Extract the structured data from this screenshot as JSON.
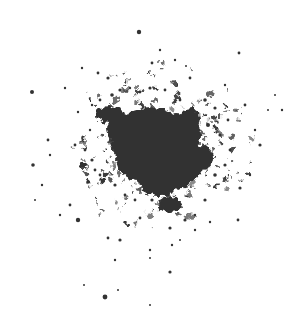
{
  "image": {
    "width": 303,
    "height": 335,
    "background": "#ffffff",
    "subject": "dark particle splatter cluster",
    "ink_color": "#333333",
    "core": {
      "cx": 158,
      "cy": 147,
      "blobs": [
        {
          "cx": 150,
          "cy": 140,
          "rx": 40,
          "ry": 32
        },
        {
          "cx": 168,
          "cy": 160,
          "rx": 36,
          "ry": 30
        },
        {
          "cx": 140,
          "cy": 160,
          "rx": 24,
          "ry": 20
        },
        {
          "cx": 175,
          "cy": 135,
          "rx": 26,
          "ry": 22
        },
        {
          "cx": 160,
          "cy": 180,
          "rx": 22,
          "ry": 16
        },
        {
          "cx": 125,
          "cy": 130,
          "rx": 18,
          "ry": 14
        },
        {
          "cx": 110,
          "cy": 115,
          "rx": 14,
          "ry": 8
        },
        {
          "cx": 190,
          "cy": 118,
          "rx": 10,
          "ry": 10
        },
        {
          "cx": 200,
          "cy": 158,
          "rx": 14,
          "ry": 12
        },
        {
          "cx": 170,
          "cy": 205,
          "rx": 12,
          "ry": 8
        }
      ]
    },
    "specks": [
      [
        139,
        32,
        2.2
      ],
      [
        32,
        92,
        2
      ],
      [
        33,
        165,
        1.8
      ],
      [
        105,
        297,
        2.4
      ],
      [
        170,
        272,
        1.6
      ],
      [
        239,
        53,
        1.4
      ],
      [
        78,
        220,
        2.2
      ],
      [
        120,
        240,
        1.6
      ],
      [
        108,
        238,
        1.4
      ],
      [
        170,
        228,
        1.6
      ],
      [
        240,
        188,
        1.6
      ],
      [
        238,
        220,
        1.4
      ],
      [
        260,
        145,
        1.6
      ],
      [
        245,
        105,
        1.4
      ],
      [
        225,
        85,
        1.2
      ],
      [
        205,
        100,
        1.8
      ],
      [
        190,
        78,
        1.4
      ],
      [
        152,
        63,
        1.4
      ],
      [
        160,
        50,
        1.2
      ],
      [
        98,
        73,
        1.4
      ],
      [
        108,
        78,
        1.6
      ],
      [
        92,
        105,
        1.2
      ],
      [
        78,
        112,
        1.2
      ],
      [
        48,
        140,
        1.4
      ],
      [
        50,
        155,
        1.2
      ],
      [
        42,
        185,
        1.2
      ],
      [
        70,
        205,
        1.4
      ],
      [
        88,
        182,
        1.8
      ],
      [
        95,
        170,
        1.4
      ],
      [
        75,
        145,
        1.4
      ],
      [
        150,
        250,
        1.2
      ],
      [
        140,
        218,
        1.4
      ],
      [
        152,
        200,
        1.6
      ],
      [
        135,
        200,
        1.4
      ],
      [
        195,
        215,
        1.2
      ],
      [
        205,
        200,
        1.6
      ],
      [
        215,
        175,
        1.8
      ],
      [
        225,
        165,
        1.6
      ],
      [
        230,
        150,
        1.4
      ],
      [
        228,
        120,
        1.4
      ],
      [
        215,
        108,
        1.6
      ],
      [
        208,
        125,
        2
      ],
      [
        220,
        135,
        1.6
      ],
      [
        180,
        100,
        1.4
      ],
      [
        165,
        90,
        1.4
      ],
      [
        150,
        88,
        1.6
      ],
      [
        140,
        92,
        1.4
      ],
      [
        130,
        88,
        1.2
      ],
      [
        120,
        90,
        1.6
      ],
      [
        112,
        95,
        1.8
      ],
      [
        100,
        100,
        1.4
      ],
      [
        90,
        130,
        1.2
      ],
      [
        85,
        150,
        1.4
      ],
      [
        92,
        160,
        1.6
      ],
      [
        100,
        175,
        1.4
      ],
      [
        115,
        185,
        1.6
      ],
      [
        125,
        195,
        1.4
      ],
      [
        185,
        220,
        1.6
      ],
      [
        195,
        230,
        1.2
      ],
      [
        210,
        222,
        1.2
      ],
      [
        250,
        175,
        1.2
      ],
      [
        255,
        130,
        1.2
      ],
      [
        268,
        110,
        1
      ],
      [
        282,
        110,
        1.2
      ],
      [
        275,
        95,
        1
      ],
      [
        60,
        215,
        1.2
      ],
      [
        65,
        88,
        1.2
      ],
      [
        82,
        68,
        1.2
      ],
      [
        175,
        60,
        1.2
      ],
      [
        186,
        66,
        1
      ],
      [
        115,
        260,
        1.2
      ],
      [
        150,
        258,
        1
      ],
      [
        172,
        245,
        1.2
      ],
      [
        180,
        240,
        1
      ],
      [
        118,
        290,
        1
      ],
      [
        150,
        305,
        1
      ],
      [
        84,
        285,
        1
      ],
      [
        35,
        200,
        1
      ]
    ]
  }
}
